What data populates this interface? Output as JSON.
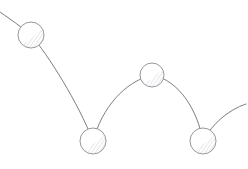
{
  "figure": {
    "canvas": {
      "width": 248,
      "height": 169
    },
    "background_color": "#ffffff",
    "stroke_color": "#6e6e76",
    "circle_stroke_color": "#8a8a92",
    "circle_fill_color": "#ffffff",
    "shading_color": "#b9b9c2",
    "stroke_width": 0.9,
    "circle_stroke_width": 0.9
  },
  "chart_data": {
    "type": "line",
    "xlabel": "",
    "ylabel": "",
    "xlim": [
      0,
      248
    ],
    "ylim": [
      0,
      169
    ],
    "grid": false,
    "legend": "none",
    "note": "Pixel coordinates, y increases downward, matching the image raster.",
    "series": [
      {
        "name": "trajectory",
        "description": "Continuous bouncing path drawn left to right as a chain of parabolic arcs",
        "segments": [
          {
            "name": "entry-arc",
            "path": "M 0 12 Q 15 22 31 35",
            "start": [
              0,
              12
            ],
            "end": [
              31,
              35
            ]
          },
          {
            "name": "first-fall-arc",
            "path": "M 31 35 C 48 55 78 102 93 141",
            "start": [
              31,
              35
            ],
            "end": [
              93,
              141
            ]
          },
          {
            "name": "first-bounce-arc",
            "path": "M 93 141 C 102 108 124 82 152 75",
            "start": [
              93,
              141
            ],
            "end": [
              152,
              75
            ]
          },
          {
            "name": "second-fall-arc",
            "path": "M 152 75 C 180 80 198 112 203 141",
            "start": [
              152,
              75
            ],
            "end": [
              203,
              141
            ]
          },
          {
            "name": "exit-arc",
            "path": "M 203 141 C 212 124 228 110 246 104",
            "start": [
              203,
              141
            ],
            "end": [
              246,
              104
            ]
          }
        ]
      }
    ],
    "markers": [
      {
        "label": "ball-position-1",
        "cx": 31,
        "cy": 35,
        "r": 13
      },
      {
        "label": "ball-position-2",
        "cx": 93,
        "cy": 141,
        "r": 13
      },
      {
        "label": "ball-position-3",
        "cx": 152,
        "cy": 75,
        "r": 12
      },
      {
        "label": "ball-position-4",
        "cx": 203,
        "cy": 141,
        "r": 13
      }
    ],
    "values": [
      12,
      35,
      141,
      75,
      141,
      104
    ],
    "x": [
      0,
      31,
      93,
      152,
      203,
      246
    ]
  }
}
